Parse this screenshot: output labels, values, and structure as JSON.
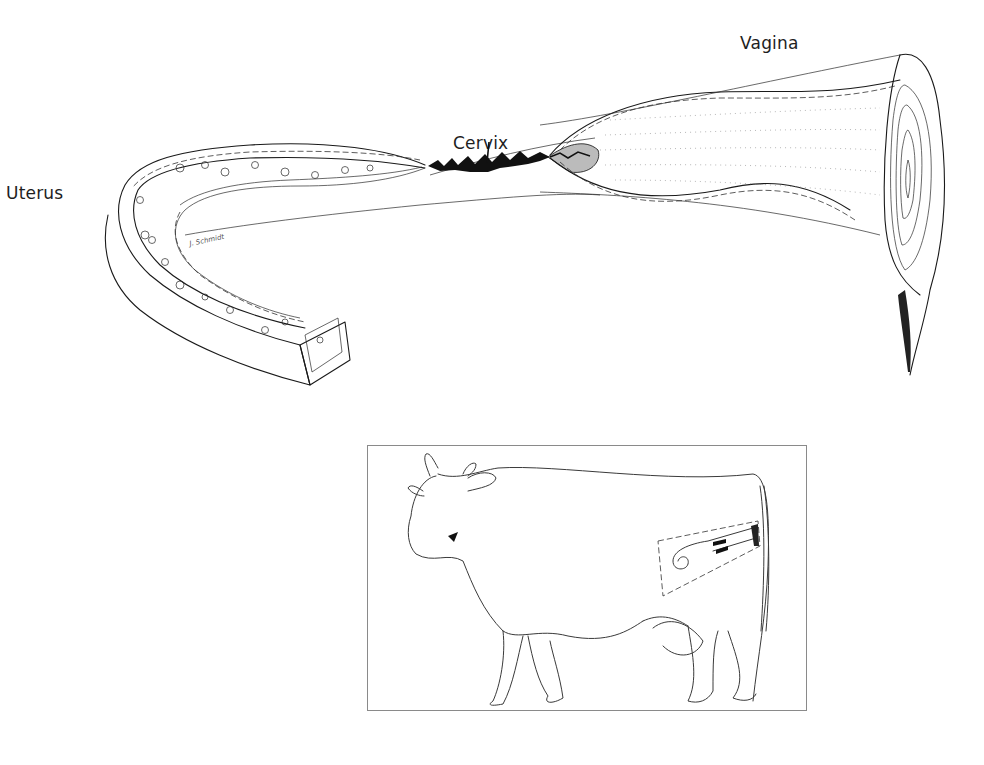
{
  "figure": {
    "labels": {
      "uterus": "Uterus",
      "cervix": "Cervix",
      "vagina": "Vagina"
    },
    "signature": "J. Schmidt",
    "inset": {
      "subject": "cow",
      "highlight": "reproductive-tract-location"
    },
    "colors": {
      "ink": "#1a1a1a",
      "inset_border": "#8a8a8a",
      "background": "#ffffff"
    }
  }
}
